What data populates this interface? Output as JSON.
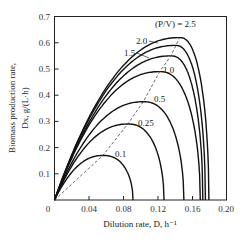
{
  "chart_data": {
    "type": "line",
    "title": "",
    "xlabel": "Dilution rate, D, h⁻¹",
    "ylabel_line1": "Biomass production rate,",
    "ylabel_line2": "Dx, g/(L·h)",
    "xlim": [
      0,
      0.2
    ],
    "ylim": [
      0,
      0.7
    ],
    "grid": false,
    "legend": "inline labels",
    "x_ticks": [
      "0",
      "0.04",
      "0.08",
      "0.12",
      "0.16",
      "0.20"
    ],
    "y_ticks": [
      "0.1",
      "0.2",
      "0.3",
      "0.4",
      "0.5",
      "0.6",
      "0.7"
    ],
    "parameter_label": "(P/V) = 2.5",
    "series": [
      {
        "name": "0.1",
        "label": "0.1",
        "peak_D": 0.056,
        "peak_P": 0.17,
        "washout_D": 0.091
      },
      {
        "name": "0.25",
        "label": "0.25",
        "peak_D": 0.085,
        "peak_P": 0.29,
        "washout_D": 0.127
      },
      {
        "name": "0.5",
        "label": "0.5",
        "peak_D": 0.103,
        "peak_P": 0.375,
        "washout_D": 0.15
      },
      {
        "name": "1.0",
        "label": "1.0",
        "peak_D": 0.122,
        "peak_P": 0.49,
        "washout_D": 0.169
      },
      {
        "name": "1.5",
        "label": "1.5",
        "peak_D": 0.135,
        "peak_P": 0.55,
        "washout_D": 0.172
      },
      {
        "name": "2.0",
        "label": "2.0",
        "peak_D": 0.14,
        "peak_P": 0.59,
        "washout_D": 0.175
      },
      {
        "name": "2.5",
        "label": "2.5",
        "peak_D": 0.145,
        "peak_P": 0.62,
        "washout_D": 0.179
      }
    ],
    "locus_of_maxima": {
      "style": "dashed",
      "points": [
        [
          0,
          0
        ],
        [
          0.056,
          0.17
        ],
        [
          0.085,
          0.29
        ],
        [
          0.103,
          0.375
        ],
        [
          0.122,
          0.49
        ],
        [
          0.135,
          0.55
        ],
        [
          0.145,
          0.62
        ]
      ]
    },
    "colors": {
      "curve": "#111111",
      "axis": "#222222",
      "dashed": "#444444"
    }
  }
}
